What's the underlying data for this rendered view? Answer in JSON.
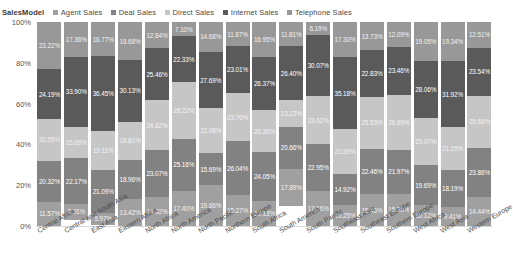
{
  "legend": {
    "title": "SalesModel",
    "items": [
      {
        "label": "Agent Sales",
        "color": "#a0a0a0"
      },
      {
        "label": "Deal Sales",
        "color": "#828282"
      },
      {
        "label": "Direct Sales",
        "color": "#c6c6c6"
      },
      {
        "label": "Internet Sales",
        "color": "#5a5a5a"
      },
      {
        "label": "Telephone Sales",
        "color": "#989898"
      }
    ]
  },
  "yaxis": {
    "ticks": [
      "100%",
      "80%",
      "60%",
      "40%",
      "20%",
      "0%"
    ],
    "min": 0,
    "max": 100
  },
  "chart_data": {
    "type": "bar",
    "title": "",
    "xlabel": "",
    "ylabel": "",
    "ylim": [
      0,
      100
    ],
    "grid": false,
    "stacked": true,
    "normalized": true,
    "legend_position": "top",
    "categories": [
      "Central Africa",
      "Central and South Asia",
      "East Asia",
      "Eastern Africa",
      "North Africa",
      "North America",
      "North Pacific",
      "Northern Europe",
      "South Africa",
      "South America",
      "South Pacific",
      "Southeast Asia",
      "Southeast Europe",
      "Southern Europe",
      "West Africa",
      "West Asia",
      "Western Europe"
    ],
    "series": [
      {
        "name": "Telephone Sales",
        "color": "#989898",
        "values": [
          23.22,
          17.36,
          16.77,
          18.68,
          12.84,
          7.1,
          14.68,
          11.87,
          16.95,
          11.81,
          6.19,
          17.3,
          13.73,
          12.09,
          19.05,
          19.34,
          12.51
        ]
      },
      {
        "name": "Internet Sales",
        "color": "#5a5a5a",
        "values": [
          24.19,
          33.9,
          36.45,
          30.13,
          25.46,
          22.33,
          27.69,
          23.01,
          26.37,
          26.4,
          30.07,
          35.18,
          22.83,
          23.46,
          28.06,
          31.92,
          23.54
        ]
      },
      {
        "name": "Direct Sales",
        "color": "#c6c6c6",
        "values": [
          20.55,
          15.66,
          19.11,
          18.81,
          24.62,
          28.22,
          22.08,
          23.7,
          20.36,
          13.23,
          23.62,
          22.26,
          25.53,
          26.99,
          23.07,
          21.15,
          25.66
        ]
      },
      {
        "name": "Deal Sales",
        "color": "#828282",
        "values": [
          20.32,
          22.17,
          21.09,
          18.96,
          23.07,
          25.16,
          15.69,
          26.04,
          24.05,
          20.66,
          22.95,
          14.92,
          22.46,
          21.97,
          19.69,
          18.19,
          23.86
        ]
      },
      {
        "name": "Agent Sales",
        "color": "#a0a0a0",
        "values": [
          11.57,
          7.91,
          5.97,
          13.42,
          14.02,
          17.4,
          19.86,
          15.27,
          12.13,
          17.89,
          17.16,
          10.25,
          15.45,
          15.3,
          10.12,
          9.41,
          14.44
        ]
      }
    ]
  }
}
